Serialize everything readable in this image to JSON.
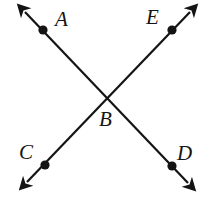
{
  "figure": {
    "type": "geometry-diagram",
    "width": 202,
    "height": 198,
    "background_color": "#ffffff",
    "stroke_color": "#141414",
    "stroke_width": 2.2,
    "dot_color": "#141414",
    "dot_radius": 4.6,
    "label_color": "#141414",
    "label_font_size": 21,
    "intersection": {
      "name": "B",
      "x": 108,
      "y": 97
    },
    "lines": [
      {
        "name": "line-AD",
        "through": [
          "A",
          "B",
          "D"
        ],
        "arrow_start": {
          "x": 25,
          "y": 12
        },
        "arrow_end": {
          "x": 188,
          "y": 183
        },
        "double_headed": true
      },
      {
        "name": "line-CE",
        "through": [
          "C",
          "B",
          "E"
        ],
        "arrow_start": {
          "x": 27,
          "y": 182
        },
        "arrow_end": {
          "x": 190,
          "y": 12
        },
        "double_headed": true
      }
    ],
    "points": [
      {
        "name": "A",
        "label": "A",
        "dot_x": 43,
        "dot_y": 30,
        "label_x": 55,
        "label_y": 9,
        "has_dot": true
      },
      {
        "name": "E",
        "label": "E",
        "dot_x": 172,
        "dot_y": 30,
        "label_x": 146,
        "label_y": 7,
        "has_dot": true
      },
      {
        "name": "B",
        "label": "B",
        "dot_x": 108,
        "dot_y": 97,
        "label_x": 99,
        "label_y": 109,
        "has_dot": false
      },
      {
        "name": "C",
        "label": "C",
        "dot_x": 45,
        "dot_y": 165,
        "label_x": 19,
        "label_y": 142,
        "has_dot": true
      },
      {
        "name": "D",
        "label": "D",
        "dot_x": 172,
        "dot_y": 166,
        "label_x": 177,
        "label_y": 143,
        "has_dot": true
      }
    ]
  }
}
